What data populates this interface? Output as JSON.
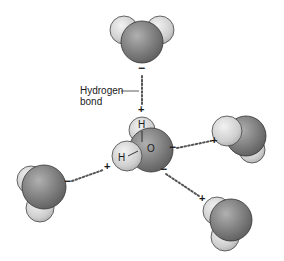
{
  "diagram": {
    "title": "",
    "label": {
      "line1": "Hydrogen",
      "line2": "bond"
    },
    "central_molecule": {
      "atoms": {
        "oxygen": "O",
        "hydrogen_top": "H",
        "hydrogen_left": "H"
      }
    },
    "charges": {
      "plus": "+",
      "minus": "−"
    },
    "colors": {
      "oxygen": "#7a7a7a",
      "oxygen_highlight": "#a8a8a8",
      "hydrogen": "#d2d2d2",
      "hydrogen_highlight": "#efefef",
      "outline": "#3a3a3a",
      "bond_dots": "#555555",
      "text": "#1a1a1a"
    }
  }
}
